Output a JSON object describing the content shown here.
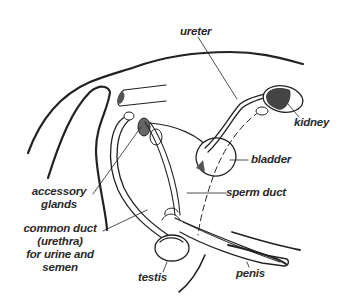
{
  "diagram": {
    "labels": {
      "ureter": "ureter",
      "kidney": "kidney",
      "bladder": "bladder",
      "sperm_duct": "sperm duct",
      "accessory_glands": [
        "accessory",
        "glands"
      ],
      "common_duct": [
        "common duct",
        "(urethra)",
        "for urine and",
        "semen"
      ],
      "testis": "testis",
      "penis": "penis"
    }
  }
}
